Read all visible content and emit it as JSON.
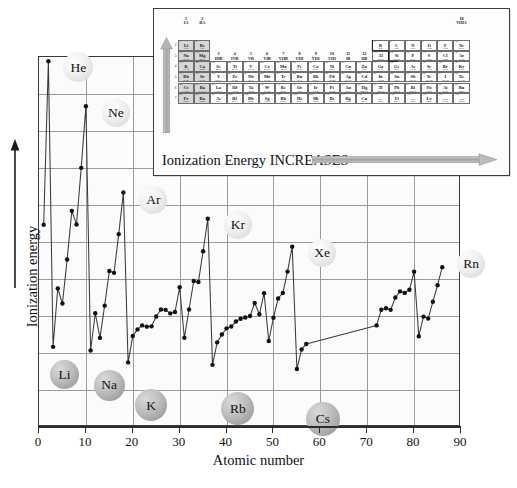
{
  "chart_data": {
    "type": "line",
    "title": "",
    "xlabel": "Atomic number",
    "ylabel": "Ionization energy",
    "xlim": [
      0,
      90
    ],
    "xticks": [
      0,
      10,
      20,
      30,
      40,
      50,
      60,
      70,
      80,
      90
    ],
    "ylim": [
      0,
      2400
    ],
    "yticks": [],
    "grid": true,
    "legend": false,
    "x": [
      1,
      2,
      3,
      4,
      5,
      6,
      7,
      8,
      9,
      10,
      11,
      12,
      13,
      14,
      15,
      16,
      17,
      18,
      19,
      20,
      21,
      22,
      23,
      24,
      25,
      26,
      27,
      28,
      29,
      30,
      31,
      32,
      33,
      34,
      35,
      36,
      37,
      38,
      39,
      40,
      41,
      42,
      43,
      44,
      45,
      46,
      47,
      48,
      49,
      50,
      51,
      52,
      53,
      54,
      55,
      56,
      57,
      72,
      73,
      74,
      75,
      76,
      77,
      78,
      79,
      80,
      81,
      82,
      83,
      84,
      85,
      86
    ],
    "values": [
      1312,
      2372,
      520,
      899,
      801,
      1086,
      1402,
      1314,
      1681,
      2081,
      496,
      738,
      578,
      787,
      1012,
      1000,
      1251,
      1521,
      419,
      590,
      633,
      659,
      651,
      653,
      717,
      762,
      760,
      737,
      746,
      906,
      579,
      762,
      947,
      941,
      1140,
      1351,
      403,
      549,
      600,
      640,
      652,
      684,
      702,
      710,
      720,
      804,
      731,
      868,
      558,
      709,
      834,
      869,
      1008,
      1170,
      376,
      503,
      538,
      659,
      761,
      770,
      760,
      840,
      880,
      870,
      890,
      1007,
      589,
      716,
      703,
      812,
      920,
      1037
    ],
    "annotations": [
      {
        "label": "He",
        "x": 2,
        "style": "noble"
      },
      {
        "label": "Ne",
        "x": 10,
        "style": "noble"
      },
      {
        "label": "Ar",
        "x": 18,
        "style": "noble"
      },
      {
        "label": "Kr",
        "x": 36,
        "style": "noble"
      },
      {
        "label": "Xe",
        "x": 54,
        "style": "noble"
      },
      {
        "label": "Rn",
        "x": 86,
        "style": "noble"
      },
      {
        "label": "Li",
        "x": 3,
        "style": "alkali"
      },
      {
        "label": "Na",
        "x": 11,
        "style": "alkali"
      },
      {
        "label": "K",
        "x": 19,
        "style": "alkali"
      },
      {
        "label": "Rb",
        "x": 37,
        "style": "alkali"
      },
      {
        "label": "Cs",
        "x": 55,
        "style": "alkali"
      }
    ]
  },
  "axes": {
    "x_title": "Atomic number",
    "y_title": "Ionization energy",
    "x_tick_labels": [
      "0",
      "10",
      "20",
      "30",
      "40",
      "50",
      "60",
      "70",
      "80",
      "90"
    ]
  },
  "inset": {
    "caption": "Ionization Energy INCREASES",
    "group_headers_left": [
      {
        "arabic": "1",
        "roman": "IA"
      },
      {
        "arabic": "2",
        "roman": "IIA"
      }
    ],
    "group_headers_mid": [
      {
        "arabic": "3",
        "roman": "IIIB"
      },
      {
        "arabic": "4",
        "roman": "IVB"
      },
      {
        "arabic": "5",
        "roman": "VB"
      },
      {
        "arabic": "6",
        "roman": "VIB"
      },
      {
        "arabic": "7",
        "roman": "VIIB"
      },
      {
        "arabic": "8",
        "roman": "VIII"
      },
      {
        "arabic": "9",
        "roman": "VIII"
      },
      {
        "arabic": "10",
        "roman": "VIII"
      },
      {
        "arabic": "11",
        "roman": "IB"
      },
      {
        "arabic": "12",
        "roman": "IIB"
      }
    ],
    "group_headers_right": [
      {
        "arabic": "13",
        "roman": "IIIA"
      },
      {
        "arabic": "14",
        "roman": "IVA"
      },
      {
        "arabic": "15",
        "roman": "VA"
      },
      {
        "arabic": "16",
        "roman": "VIA"
      },
      {
        "arabic": "17",
        "roman": "VIIA"
      },
      {
        "arabic": "18",
        "roman": "VIIIA"
      }
    ],
    "period_numbers": [
      "1",
      "2",
      "3",
      "4",
      "5",
      "6",
      "7"
    ],
    "elements": [
      {
        "z": "1",
        "sym": "H",
        "mass": "1.008",
        "g": 1,
        "p": 1,
        "shade": false
      },
      {
        "z": "2",
        "sym": "He",
        "mass": "4.00",
        "g": 18,
        "p": 1,
        "shade": false
      },
      {
        "z": "3",
        "sym": "Li",
        "mass": "6.94",
        "g": 1,
        "p": 2,
        "shade": true
      },
      {
        "z": "4",
        "sym": "Be",
        "mass": "9.01",
        "g": 2,
        "p": 2,
        "shade": true
      },
      {
        "z": "5",
        "sym": "B",
        "mass": "10.81",
        "g": 13,
        "p": 2,
        "shade": false
      },
      {
        "z": "6",
        "sym": "C",
        "mass": "12.01",
        "g": 14,
        "p": 2,
        "shade": false
      },
      {
        "z": "7",
        "sym": "N",
        "mass": "14.01",
        "g": 15,
        "p": 2,
        "shade": false
      },
      {
        "z": "8",
        "sym": "O",
        "mass": "16.00",
        "g": 16,
        "p": 2,
        "shade": false
      },
      {
        "z": "9",
        "sym": "F",
        "mass": "19.00",
        "g": 17,
        "p": 2,
        "shade": false
      },
      {
        "z": "10",
        "sym": "Ne",
        "mass": "20.18",
        "g": 18,
        "p": 2,
        "shade": false
      },
      {
        "z": "11",
        "sym": "Na",
        "mass": "22.99",
        "g": 1,
        "p": 3,
        "shade": true
      },
      {
        "z": "12",
        "sym": "Mg",
        "mass": "24.31",
        "g": 2,
        "p": 3,
        "shade": true
      },
      {
        "z": "13",
        "sym": "Al",
        "mass": "26.98",
        "g": 13,
        "p": 3,
        "shade": false
      },
      {
        "z": "14",
        "sym": "Si",
        "mass": "28.09",
        "g": 14,
        "p": 3,
        "shade": false
      },
      {
        "z": "15",
        "sym": "P",
        "mass": "30.97",
        "g": 15,
        "p": 3,
        "shade": false
      },
      {
        "z": "16",
        "sym": "S",
        "mass": "32.07",
        "g": 16,
        "p": 3,
        "shade": false
      },
      {
        "z": "17",
        "sym": "Cl",
        "mass": "35.45",
        "g": 17,
        "p": 3,
        "shade": false
      },
      {
        "z": "18",
        "sym": "Ar",
        "mass": "39.95",
        "g": 18,
        "p": 3,
        "shade": false
      },
      {
        "z": "19",
        "sym": "K",
        "mass": "39.10",
        "g": 1,
        "p": 4,
        "shade": true
      },
      {
        "z": "20",
        "sym": "Ca",
        "mass": "40.08",
        "g": 2,
        "p": 4,
        "shade": true
      },
      {
        "z": "21",
        "sym": "Sc",
        "mass": "44.96",
        "g": 3,
        "p": 4,
        "shade": false
      },
      {
        "z": "22",
        "sym": "Ti",
        "mass": "47.88",
        "g": 4,
        "p": 4,
        "shade": false
      },
      {
        "z": "23",
        "sym": "V",
        "mass": "50.94",
        "g": 5,
        "p": 4,
        "shade": false
      },
      {
        "z": "24",
        "sym": "Cr",
        "mass": "52.00",
        "g": 6,
        "p": 4,
        "shade": false
      },
      {
        "z": "25",
        "sym": "Mn",
        "mass": "54.94",
        "g": 7,
        "p": 4,
        "shade": false
      },
      {
        "z": "26",
        "sym": "Fe",
        "mass": "55.85",
        "g": 8,
        "p": 4,
        "shade": false
      },
      {
        "z": "27",
        "sym": "Co",
        "mass": "58.93",
        "g": 9,
        "p": 4,
        "shade": false
      },
      {
        "z": "28",
        "sym": "Ni",
        "mass": "58.69",
        "g": 10,
        "p": 4,
        "shade": false
      },
      {
        "z": "29",
        "sym": "Cu",
        "mass": "63.55",
        "g": 11,
        "p": 4,
        "shade": false
      },
      {
        "z": "30",
        "sym": "Zn",
        "mass": "65.39",
        "g": 12,
        "p": 4,
        "shade": false
      },
      {
        "z": "31",
        "sym": "Ga",
        "mass": "69.72",
        "g": 13,
        "p": 4,
        "shade": false
      },
      {
        "z": "32",
        "sym": "Ge",
        "mass": "72.61",
        "g": 14,
        "p": 4,
        "shade": false
      },
      {
        "z": "33",
        "sym": "As",
        "mass": "74.92",
        "g": 15,
        "p": 4,
        "shade": false
      },
      {
        "z": "34",
        "sym": "Se",
        "mass": "78.96",
        "g": 16,
        "p": 4,
        "shade": false
      },
      {
        "z": "35",
        "sym": "Br",
        "mass": "79.90",
        "g": 17,
        "p": 4,
        "shade": false
      },
      {
        "z": "36",
        "sym": "Kr",
        "mass": "83.80",
        "g": 18,
        "p": 4,
        "shade": false
      },
      {
        "z": "37",
        "sym": "Rb",
        "mass": "85.47",
        "g": 1,
        "p": 5,
        "shade": true
      },
      {
        "z": "38",
        "sym": "Sr",
        "mass": "87.62",
        "g": 2,
        "p": 5,
        "shade": true
      },
      {
        "z": "39",
        "sym": "Y",
        "mass": "88.91",
        "g": 3,
        "p": 5,
        "shade": false
      },
      {
        "z": "40",
        "sym": "Zr",
        "mass": "91.22",
        "g": 4,
        "p": 5,
        "shade": false
      },
      {
        "z": "41",
        "sym": "Nb",
        "mass": "92.91",
        "g": 5,
        "p": 5,
        "shade": false
      },
      {
        "z": "42",
        "sym": "Mo",
        "mass": "95.94",
        "g": 6,
        "p": 5,
        "shade": false
      },
      {
        "z": "43",
        "sym": "Tc",
        "mass": "(98)",
        "g": 7,
        "p": 5,
        "shade": false
      },
      {
        "z": "44",
        "sym": "Ru",
        "mass": "101.1",
        "g": 8,
        "p": 5,
        "shade": false
      },
      {
        "z": "45",
        "sym": "Rh",
        "mass": "102.91",
        "g": 9,
        "p": 5,
        "shade": false
      },
      {
        "z": "46",
        "sym": "Pd",
        "mass": "106.42",
        "g": 10,
        "p": 5,
        "shade": false
      },
      {
        "z": "47",
        "sym": "Ag",
        "mass": "107.87",
        "g": 11,
        "p": 5,
        "shade": false
      },
      {
        "z": "48",
        "sym": "Cd",
        "mass": "112.41",
        "g": 12,
        "p": 5,
        "shade": false
      },
      {
        "z": "49",
        "sym": "In",
        "mass": "114.82",
        "g": 13,
        "p": 5,
        "shade": false
      },
      {
        "z": "50",
        "sym": "Sn",
        "mass": "118.71",
        "g": 14,
        "p": 5,
        "shade": false
      },
      {
        "z": "51",
        "sym": "Sb",
        "mass": "121.76",
        "g": 15,
        "p": 5,
        "shade": false
      },
      {
        "z": "52",
        "sym": "Te",
        "mass": "127.60",
        "g": 16,
        "p": 5,
        "shade": false
      },
      {
        "z": "53",
        "sym": "I",
        "mass": "126.90",
        "g": 17,
        "p": 5,
        "shade": false
      },
      {
        "z": "54",
        "sym": "Xe",
        "mass": "131.29",
        "g": 18,
        "p": 5,
        "shade": false
      },
      {
        "z": "55",
        "sym": "Cs",
        "mass": "132.91",
        "g": 1,
        "p": 6,
        "shade": true
      },
      {
        "z": "56",
        "sym": "Ba",
        "mass": "137.33",
        "g": 2,
        "p": 6,
        "shade": true
      },
      {
        "z": "57",
        "sym": "La",
        "mass": "138.91",
        "g": 3,
        "p": 6,
        "shade": false
      },
      {
        "z": "72",
        "sym": "Hf",
        "mass": "178.49",
        "g": 4,
        "p": 6,
        "shade": false
      },
      {
        "z": "73",
        "sym": "Ta",
        "mass": "180.95",
        "g": 5,
        "p": 6,
        "shade": false
      },
      {
        "z": "74",
        "sym": "W",
        "mass": "183.85",
        "g": 6,
        "p": 6,
        "shade": false
      },
      {
        "z": "75",
        "sym": "Re",
        "mass": "186.21",
        "g": 7,
        "p": 6,
        "shade": false
      },
      {
        "z": "76",
        "sym": "Os",
        "mass": "190.2",
        "g": 8,
        "p": 6,
        "shade": false
      },
      {
        "z": "77",
        "sym": "Ir",
        "mass": "192.22",
        "g": 9,
        "p": 6,
        "shade": false
      },
      {
        "z": "78",
        "sym": "Pt",
        "mass": "195.08",
        "g": 10,
        "p": 6,
        "shade": false
      },
      {
        "z": "79",
        "sym": "Au",
        "mass": "196.97",
        "g": 11,
        "p": 6,
        "shade": false
      },
      {
        "z": "80",
        "sym": "Hg",
        "mass": "200.59",
        "g": 12,
        "p": 6,
        "shade": false
      },
      {
        "z": "81",
        "sym": "Tl",
        "mass": "204.38",
        "g": 13,
        "p": 6,
        "shade": false
      },
      {
        "z": "82",
        "sym": "Pb",
        "mass": "207.2",
        "g": 14,
        "p": 6,
        "shade": false
      },
      {
        "z": "83",
        "sym": "Bi",
        "mass": "208.98",
        "g": 15,
        "p": 6,
        "shade": false
      },
      {
        "z": "84",
        "sym": "Po",
        "mass": "(209)",
        "g": 16,
        "p": 6,
        "shade": false
      },
      {
        "z": "85",
        "sym": "At",
        "mass": "(210)",
        "g": 17,
        "p": 6,
        "shade": false
      },
      {
        "z": "86",
        "sym": "Rn",
        "mass": "(222)",
        "g": 18,
        "p": 6,
        "shade": false
      },
      {
        "z": "87",
        "sym": "Fr",
        "mass": "(223)",
        "g": 1,
        "p": 7,
        "shade": true
      },
      {
        "z": "88",
        "sym": "Ra",
        "mass": "(226)",
        "g": 2,
        "p": 7,
        "shade": true
      },
      {
        "z": "89",
        "sym": "Ac",
        "mass": "(227)",
        "g": 3,
        "p": 7,
        "shade": false
      },
      {
        "z": "104",
        "sym": "Rf",
        "mass": "(261)",
        "g": 4,
        "p": 7,
        "shade": false
      },
      {
        "z": "105",
        "sym": "Db",
        "mass": "(262)",
        "g": 5,
        "p": 7,
        "shade": false
      },
      {
        "z": "106",
        "sym": "Sg",
        "mass": "(266)",
        "g": 6,
        "p": 7,
        "shade": false
      },
      {
        "z": "107",
        "sym": "Bh",
        "mass": "(264)",
        "g": 7,
        "p": 7,
        "shade": false
      },
      {
        "z": "108",
        "sym": "Hs",
        "mass": "(265)",
        "g": 8,
        "p": 7,
        "shade": false
      },
      {
        "z": "109",
        "sym": "Mt",
        "mass": "(268)",
        "g": 9,
        "p": 7,
        "shade": false
      },
      {
        "z": "110",
        "sym": "Ds",
        "mass": "(271)",
        "g": 10,
        "p": 7,
        "shade": false
      },
      {
        "z": "111",
        "sym": "Rg",
        "mass": "(272)",
        "g": 11,
        "p": 7,
        "shade": false
      },
      {
        "z": "112",
        "sym": "Cn",
        "mass": "(277)",
        "g": 12,
        "p": 7,
        "shade": false
      },
      {
        "z": "113",
        "sym": "—",
        "mass": "(284)",
        "g": 13,
        "p": 7,
        "shade": false
      },
      {
        "z": "114",
        "sym": "Fl",
        "mass": "(289)",
        "g": 14,
        "p": 7,
        "shade": false
      },
      {
        "z": "115",
        "sym": "—",
        "mass": "(288)",
        "g": 15,
        "p": 7,
        "shade": false
      },
      {
        "z": "116",
        "sym": "Lv",
        "mass": "(289)",
        "g": 16,
        "p": 7,
        "shade": false
      },
      {
        "z": "117",
        "sym": "—",
        "mass": "(294)",
        "g": 17,
        "p": 7,
        "shade": false
      },
      {
        "z": "118",
        "sym": "—",
        "mass": "(294)",
        "g": 18,
        "p": 7,
        "shade": false
      }
    ]
  }
}
